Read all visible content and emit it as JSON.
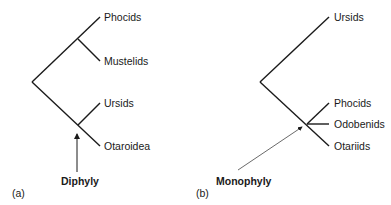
{
  "panels": [
    {
      "id": "a",
      "panel_label": "(a)",
      "annotation": "Diphyly",
      "taxa": [
        "Phocids",
        "Mustelids",
        "Ursids",
        "Otaroidea"
      ]
    },
    {
      "id": "b",
      "panel_label": "(b)",
      "annotation": "Monophyly",
      "taxa": [
        "Ursids",
        "Phocids",
        "Odobenids",
        "Otariids"
      ]
    }
  ],
  "colors": {
    "line": "#1a1a1a",
    "arrow": "#444444",
    "background": "#ffffff"
  }
}
